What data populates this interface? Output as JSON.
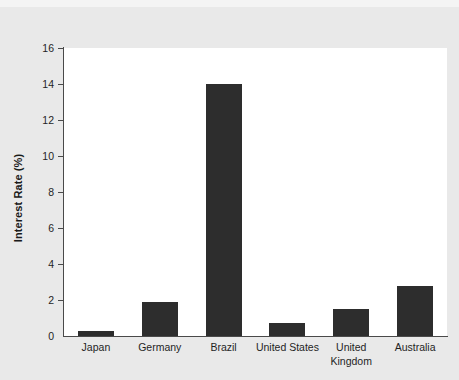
{
  "chart_data": {
    "type": "bar",
    "title": "",
    "xlabel": "",
    "ylabel": "Interest Rate (%)",
    "categories": [
      "Japan",
      "Germany",
      "Brazil",
      "United States",
      "United Kingdom",
      "Australia"
    ],
    "values": [
      0.3,
      1.9,
      14.0,
      0.7,
      1.5,
      2.8
    ],
    "ylim": [
      0,
      16
    ],
    "yticks": [
      0,
      2,
      4,
      6,
      8,
      10,
      12,
      14,
      16
    ],
    "ytick_labels": [
      "0",
      "2",
      "4",
      "6",
      "8",
      "10",
      "12",
      "14",
      "16"
    ],
    "grid": false,
    "legend": null,
    "bar_color": "#2d2d2d",
    "plot_background": "#ffffff",
    "figure_background": "#e9e9e9",
    "axis_color": "#4a4a4a"
  }
}
